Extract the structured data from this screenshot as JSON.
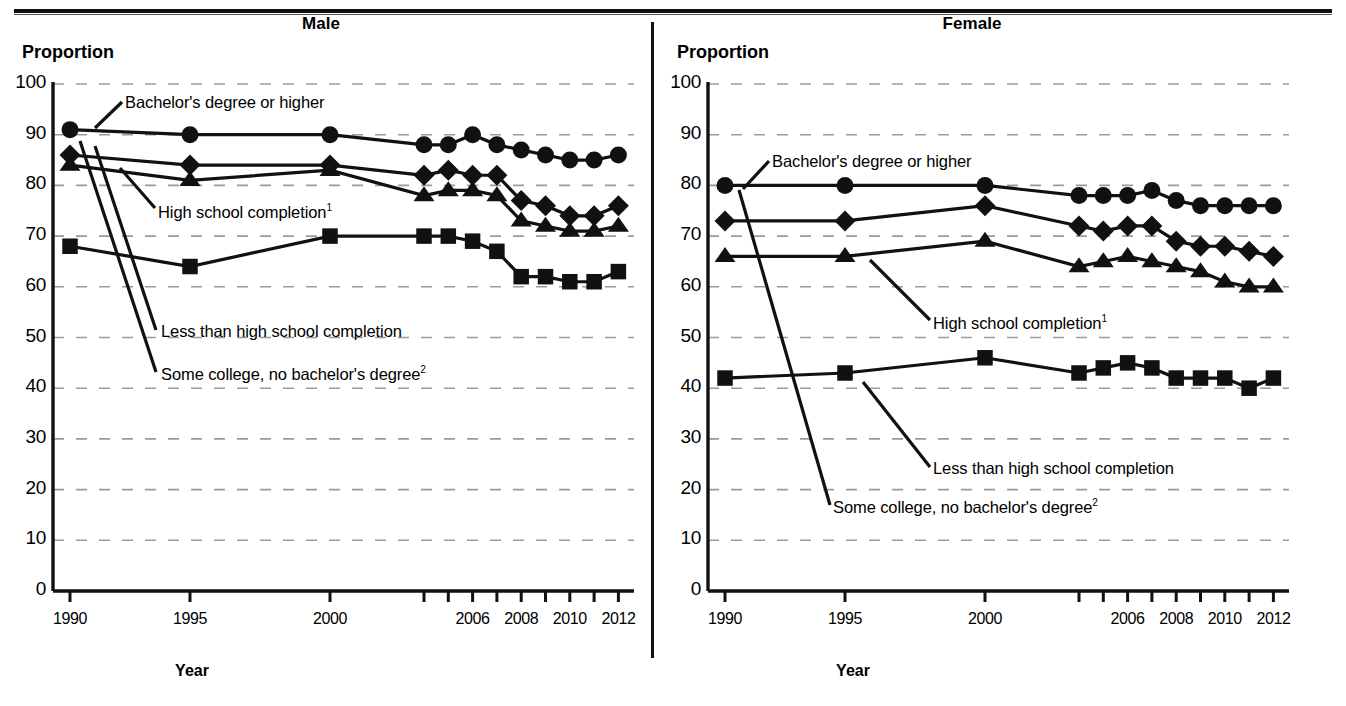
{
  "figure": {
    "y_axis_label": "Proportion",
    "x_axis_label": "Year",
    "panels": [
      "Male",
      "Female"
    ]
  },
  "male": {
    "title": "Male",
    "y_axis_label": "Proportion",
    "x_axis_label": "Year",
    "annotations": {
      "bachelor": "Bachelor's degree or higher",
      "highschool": "High school completion",
      "highschool_sup": "1",
      "lessthan": "Less than high school completion",
      "somecollege": "Some college, no bachelor's degree",
      "somecollege_sup": "2"
    }
  },
  "female": {
    "title": "Female",
    "y_axis_label": "Proportion",
    "x_axis_label": "Year",
    "annotations": {
      "bachelor": "Bachelor's degree or higher",
      "highschool": "High school completion",
      "highschool_sup": "1",
      "lessthan": "Less than high school completion",
      "somecollege": "Some college, no bachelor's degree",
      "somecollege_sup": "2"
    }
  },
  "chart_data": [
    {
      "type": "line",
      "title": "Male",
      "xlabel": "Year",
      "ylabel": "Proportion",
      "ylim": [
        0,
        100
      ],
      "ytick_labels": [
        "0",
        "10",
        "20",
        "30",
        "40",
        "50",
        "60",
        "70",
        "80",
        "90",
        "100"
      ],
      "grid": "horizontal-dotted",
      "legend": "inline-annotations",
      "x": [
        1990,
        1995,
        2000,
        2004,
        2005,
        2006,
        2007,
        2008,
        2009,
        2010,
        2011,
        2012
      ],
      "xtick_labels": [
        "1990",
        "1995",
        "2000",
        "2006",
        "2008",
        "2010",
        "2012"
      ],
      "series": [
        {
          "name": "Bachelor's degree or higher",
          "marker": "circle",
          "values": [
            91,
            90,
            90,
            88,
            88,
            90,
            88,
            87,
            86,
            85,
            85,
            86
          ]
        },
        {
          "name": "High school completion",
          "marker": "diamond",
          "values": [
            86,
            84,
            84,
            82,
            83,
            82,
            82,
            77,
            76,
            74,
            74,
            76
          ]
        },
        {
          "name": "Some college, no bachelor's degree",
          "marker": "triangle",
          "values": [
            84,
            81,
            83,
            78,
            79,
            79,
            78,
            73,
            72,
            71,
            71,
            72
          ]
        },
        {
          "name": "Less than high school completion",
          "marker": "square",
          "values": [
            68,
            64,
            70,
            70,
            70,
            69,
            67,
            62,
            62,
            61,
            61,
            63
          ]
        }
      ]
    },
    {
      "type": "line",
      "title": "Female",
      "xlabel": "Year",
      "ylabel": "Proportion",
      "ylim": [
        0,
        100
      ],
      "ytick_labels": [
        "0",
        "10",
        "20",
        "30",
        "40",
        "50",
        "60",
        "70",
        "80",
        "90",
        "100"
      ],
      "grid": "horizontal-dotted",
      "legend": "inline-annotations",
      "x": [
        1990,
        1995,
        2000,
        2004,
        2005,
        2006,
        2007,
        2008,
        2009,
        2010,
        2011,
        2012
      ],
      "xtick_labels": [
        "1990",
        "1995",
        "2000",
        "2006",
        "2008",
        "2010",
        "2012"
      ],
      "series": [
        {
          "name": "Bachelor's degree or higher",
          "marker": "circle",
          "values": [
            80,
            80,
            80,
            78,
            78,
            78,
            79,
            77,
            76,
            76,
            76,
            76
          ]
        },
        {
          "name": "High school completion",
          "marker": "diamond",
          "values": [
            73,
            73,
            76,
            72,
            71,
            72,
            72,
            69,
            68,
            68,
            67,
            66
          ]
        },
        {
          "name": "Some college, no bachelor's degree",
          "marker": "triangle",
          "values": [
            66,
            66,
            69,
            64,
            65,
            66,
            65,
            64,
            63,
            61,
            60,
            60
          ]
        },
        {
          "name": "Less than high school completion",
          "marker": "square",
          "values": [
            42,
            43,
            46,
            43,
            44,
            45,
            44,
            42,
            42,
            42,
            40,
            42
          ]
        }
      ]
    }
  ]
}
